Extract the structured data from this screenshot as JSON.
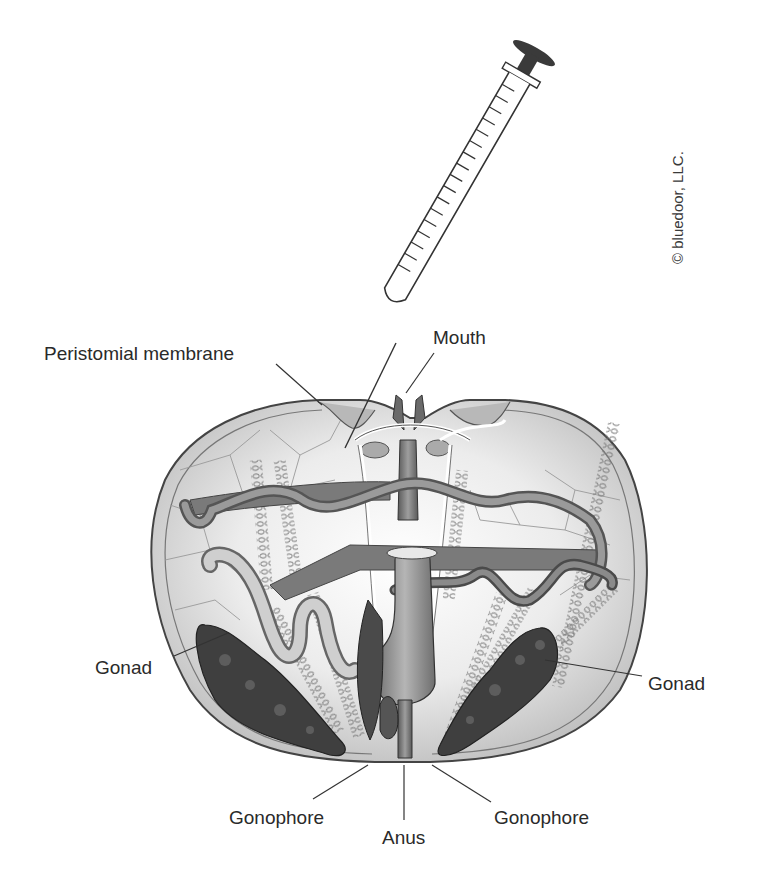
{
  "figure": {
    "copyright": "© bluedoor, LLC.",
    "colors": {
      "ink": "#2a2a2a",
      "shell_fill": "#d9d9d9",
      "shell_light": "#f0f0f0",
      "organ_dark": "#4a4a4a",
      "organ_mid": "#8a8a8a",
      "gut_fill": "#9a9a9a",
      "plunger": "#3a3a3a"
    },
    "labels": [
      {
        "id": "peristomial-membrane",
        "text": "Peristomial membrane"
      },
      {
        "id": "mouth",
        "text": "Mouth"
      },
      {
        "id": "gonad-left",
        "text": "Gonad"
      },
      {
        "id": "gonad-right",
        "text": "Gonad"
      },
      {
        "id": "gonophore-left",
        "text": "Gonophore"
      },
      {
        "id": "anus",
        "text": "Anus"
      },
      {
        "id": "gonophore-right",
        "text": "Gonophore"
      }
    ]
  }
}
